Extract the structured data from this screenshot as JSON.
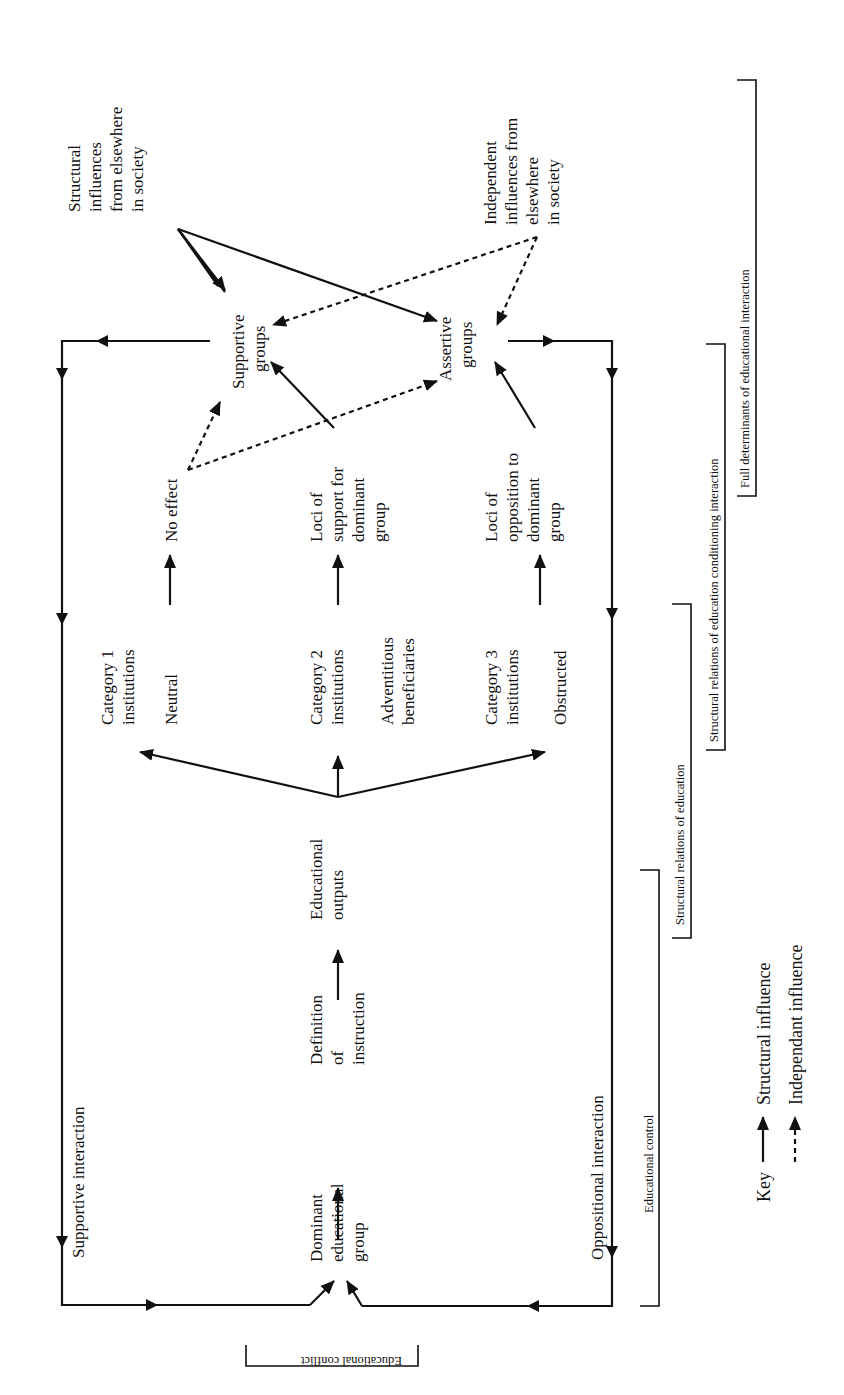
{
  "diagram": {
    "orientation": "rotated-90-ccw",
    "nodes": {
      "dominant_group": [
        "Dominant",
        "educational",
        "group"
      ],
      "definition": [
        "Definition",
        "of",
        "instruction"
      ],
      "outputs": [
        "Educational",
        "outputs"
      ],
      "cat1": [
        "Category 1",
        "institutions"
      ],
      "cat1_sub": "Neutral",
      "cat2": [
        "Category 2",
        "institutions"
      ],
      "cat2_sub": [
        "Adventitious",
        "beneficiaries"
      ],
      "cat3": [
        "Category 3",
        "institutions"
      ],
      "cat3_sub": "Obstructed",
      "no_effect": "No effect",
      "loci_support": [
        "Loci of",
        "support for",
        "dominant",
        "group"
      ],
      "loci_opposition": [
        "Loci of",
        "opposition to",
        "dominant",
        "group"
      ],
      "supportive_groups": [
        "Supportive",
        "groups"
      ],
      "assertive_groups": [
        "Assertive",
        "groups"
      ],
      "structural_influences": [
        "Structural",
        "influences",
        "from elsewhere",
        "in society"
      ],
      "independent_influences": [
        "Independent",
        "influences from",
        "elsewhere",
        "in society"
      ],
      "supportive_interaction": "Supportive interaction",
      "oppositional_interaction": "Oppositional interaction"
    },
    "brackets": {
      "educational_conflict": "Educational conflict",
      "educational_control": "Educational control",
      "structural_relations": "Structural relations of education",
      "structural_relations_conditioning": "Structural relations of education conditioning interaction",
      "full_determinants": "Full determinants of educational interaction"
    },
    "key": {
      "title": "Key",
      "structural": "Structural influence",
      "independent": "Independant influence"
    },
    "colors": {
      "ink": "#111111",
      "background": "#ffffff"
    }
  }
}
